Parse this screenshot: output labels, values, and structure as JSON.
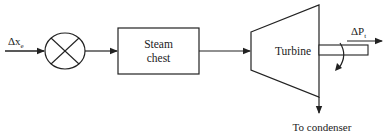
{
  "diagram": {
    "input": {
      "label_main": "Δx",
      "label_sub": "e"
    },
    "summing_junction": {
      "symbol": "circle-with-cross"
    },
    "blocks": [
      {
        "id": "steam_chest",
        "line1": "Steam",
        "line2": "chest"
      },
      {
        "id": "turbine",
        "label": "Turbine",
        "shape": "trapezoid"
      }
    ],
    "output": {
      "label_main": "ΔP",
      "label_sub": "t"
    },
    "exhaust": {
      "label": "To condenser"
    },
    "connections": [
      {
        "from": "input",
        "to": "summing_junction"
      },
      {
        "from": "summing_junction",
        "to": "steam_chest"
      },
      {
        "from": "steam_chest",
        "to": "turbine"
      },
      {
        "from": "turbine",
        "to": "output_shaft"
      },
      {
        "from": "turbine",
        "to": "condenser"
      }
    ]
  }
}
